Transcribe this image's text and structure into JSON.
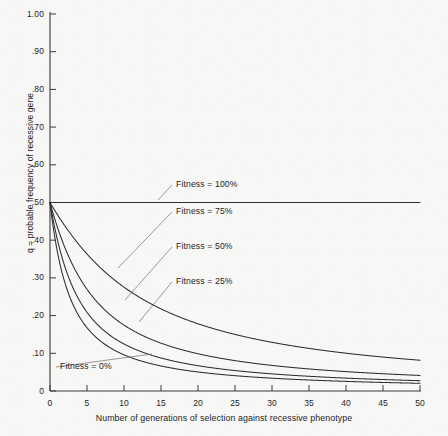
{
  "chart_data": {
    "type": "line",
    "title": "",
    "xlabel": "Number of generations of selection against recessive phenotype",
    "ylabel": "q = probable frequency of recessive gene",
    "xlim": [
      0,
      50
    ],
    "ylim": [
      0,
      1.0
    ],
    "grid": false,
    "legend_position": "inline-annotations",
    "x_ticks": [
      0,
      5,
      10,
      15,
      20,
      25,
      30,
      35,
      40,
      45,
      50
    ],
    "x_tick_labels": [
      "0",
      "5",
      "10",
      "15",
      "20",
      "25",
      "30",
      "35",
      "40",
      "45",
      "50"
    ],
    "y_ticks": [
      0,
      0.1,
      0.2,
      0.3,
      0.4,
      0.5,
      0.6,
      0.7,
      0.8,
      0.9,
      1.0
    ],
    "y_tick_labels": [
      "0",
      ".10",
      ".20",
      ".30",
      ".40",
      ".50",
      ".60",
      ".70",
      ".80",
      ".90",
      "1.00"
    ],
    "initial_q": 0.5,
    "model": "q_next = q*(1 - s*q) / (1 - s*q*q), s = 1 - fitness",
    "series": [
      {
        "name": "Fitness = 100%",
        "fitness": 1.0,
        "selection_coefficient": 0.0,
        "x": [
          0,
          5,
          10,
          15,
          20,
          25,
          30,
          35,
          40,
          45,
          50
        ],
        "values": [
          0.5,
          0.5,
          0.5,
          0.5,
          0.5,
          0.5,
          0.5,
          0.5,
          0.5,
          0.5,
          0.5
        ]
      },
      {
        "name": "Fitness = 75%",
        "fitness": 0.75,
        "selection_coefficient": 0.25,
        "x": [
          0,
          5,
          10,
          15,
          20,
          25,
          30,
          35,
          40,
          45,
          50
        ],
        "values": [
          0.5,
          0.42,
          0.37,
          0.33,
          0.3,
          0.27,
          0.25,
          0.23,
          0.22,
          0.2,
          0.19
        ]
      },
      {
        "name": "Fitness = 50%",
        "fitness": 0.5,
        "selection_coefficient": 0.5,
        "x": [
          0,
          5,
          10,
          15,
          20,
          25,
          30,
          35,
          40,
          45,
          50
        ],
        "values": [
          0.5,
          0.34,
          0.26,
          0.21,
          0.18,
          0.16,
          0.14,
          0.13,
          0.12,
          0.11,
          0.1
        ]
      },
      {
        "name": "Fitness = 25%",
        "fitness": 0.25,
        "selection_coefficient": 0.75,
        "x": [
          0,
          5,
          10,
          15,
          20,
          25,
          30,
          35,
          40,
          45,
          50
        ],
        "values": [
          0.5,
          0.26,
          0.18,
          0.14,
          0.11,
          0.09,
          0.08,
          0.07,
          0.065,
          0.06,
          0.055
        ]
      },
      {
        "name": "Fitness = 0%",
        "fitness": 0.0,
        "selection_coefficient": 1.0,
        "x": [
          0,
          5,
          10,
          15,
          20,
          25,
          30,
          35,
          40,
          45,
          50
        ],
        "values": [
          0.5,
          0.143,
          0.083,
          0.059,
          0.045,
          0.037,
          0.031,
          0.027,
          0.024,
          0.021,
          0.019
        ]
      }
    ],
    "annotations": [
      {
        "text": "Fitness = 100%",
        "series": "Fitness = 100%",
        "x_px": 176,
        "y_px": 184,
        "leader_to_x": 158,
        "leader_to_y": 200
      },
      {
        "text": "Fitness = 75%",
        "series": "Fitness = 75%",
        "x_px": 176,
        "y_px": 211,
        "leader_to_x": 118,
        "leader_to_y": 268
      },
      {
        "text": "Fitness = 50%",
        "series": "Fitness = 50%",
        "x_px": 176,
        "y_px": 246,
        "leader_to_x": 125,
        "leader_to_y": 300
      },
      {
        "text": "Fitness = 25%",
        "series": "Fitness = 25%",
        "x_px": 176,
        "y_px": 281,
        "leader_to_x": 139,
        "leader_to_y": 322
      },
      {
        "text": "Fitness = 0%",
        "series": "Fitness = 0%",
        "x_px": 60,
        "y_px": 366,
        "leader_to_x": 152,
        "leader_to_y": 354
      }
    ],
    "colors": {
      "background": "#f7f7f6",
      "axis": "#3a3a3a",
      "curve": "#2e2e2e",
      "leader": "#6e6e6e",
      "text": "#1d1d1d"
    }
  }
}
